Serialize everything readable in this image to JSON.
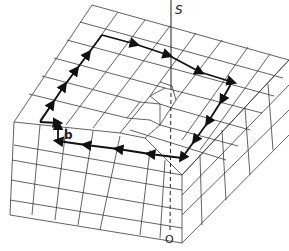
{
  "figure": {
    "labels": {
      "top_of_dislocation_line": "S",
      "bottom_of_dislocation_line": "O",
      "burgers_vector": "b"
    },
    "colors": {
      "background": "#ffffff",
      "lattice_lines": "#3a3a3a",
      "burgers_circuit": "#111111"
    }
  }
}
